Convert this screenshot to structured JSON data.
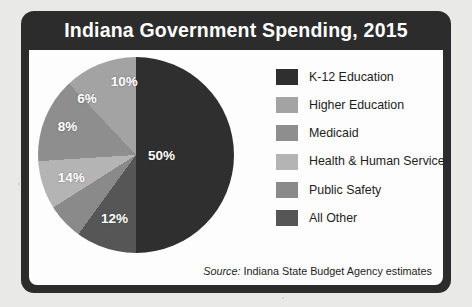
{
  "chart_data": {
    "type": "pie",
    "title": "Indiana Government Spending, 2015",
    "source": "Source: Indiana State Budget Agency estimates",
    "source_prefix": "Source:",
    "source_text": "Indiana State Budget Agency estimates",
    "legend_position": "right",
    "categories": [
      "K-12 Education",
      "Higher Education",
      "Medicaid",
      "Health & Human Services",
      "Public Safety",
      "All Other"
    ],
    "values": [
      50,
      12,
      14,
      8,
      6,
      10
    ],
    "value_labels": [
      "50%",
      "12%",
      "14%",
      "8%",
      "6%",
      "10%"
    ],
    "colors": [
      "#2f2f2f",
      "#a3a3a3",
      "#8e8e8e",
      "#b4b4b4",
      "#8a8a8a",
      "#565656"
    ],
    "units": "percent",
    "total": 100,
    "slices": [
      {
        "label": "K-12 Education",
        "value": 50,
        "display": "50%",
        "color": "#2f2f2f",
        "label_x": 63,
        "label_y": 50
      },
      {
        "label": "Higher Education",
        "value": 12,
        "display": "12%",
        "color": "#a3a3a3",
        "label_x": 39,
        "label_y": 82
      },
      {
        "label": "Medicaid",
        "value": 14,
        "display": "14%",
        "color": "#8e8e8e",
        "label_x": 17,
        "label_y": 61
      },
      {
        "label": "Health & Human Services",
        "value": 8,
        "display": "8%",
        "color": "#b4b4b4",
        "label_x": 15,
        "label_y": 35
      },
      {
        "label": "Public Safety",
        "value": 6,
        "display": "6%",
        "color": "#8a8a8a",
        "label_x": 25,
        "label_y": 21
      },
      {
        "label": "All Other",
        "value": 10,
        "display": "10%",
        "color": "#565656",
        "label_x": 44,
        "label_y": 12
      }
    ]
  },
  "frame": {
    "border_color": "#2c2c2c",
    "title_band_color": "#2c2c2c",
    "plot_background": "#fdfdfd",
    "page_background": "#e9e9e7"
  }
}
